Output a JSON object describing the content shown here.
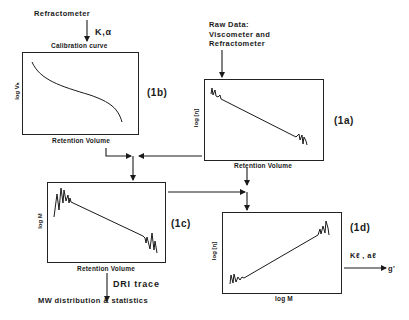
{
  "diagram": {
    "inputs": {
      "refractometer": "Refractometer",
      "k_alpha": "K,α",
      "calibration_curve": "Calibration curve",
      "raw_data_line1": "Raw Data:",
      "raw_data_line2": "Viscometer and",
      "raw_data_line3": "Refractometer"
    },
    "panels": {
      "1b": {
        "id": "(1b)",
        "ylabel": "log Vₕ",
        "xlabel": "Retention Volume",
        "curve": "calibration-curve"
      },
      "1a": {
        "id": "(1a)",
        "ylabel": "log [η]",
        "xlabel": "Retention Volume",
        "curve": "noisy-descending-line"
      },
      "1c": {
        "id": "(1c)",
        "ylabel": "log M",
        "xlabel": "Retention Volume",
        "curve": "noisy-descending-line"
      },
      "1d": {
        "id": "(1d)",
        "ylabel": "log [η]",
        "xlabel": "log M",
        "curve": "noisy-ascending-line"
      }
    },
    "outputs": {
      "dri_trace": "DRI trace",
      "mw_distribution": "MW distribution & statistics",
      "kl_al": "Kℓ , aℓ",
      "g_prime": "g'"
    },
    "colors": {
      "ink": "#1a1a1a",
      "background": "#ffffff"
    }
  }
}
